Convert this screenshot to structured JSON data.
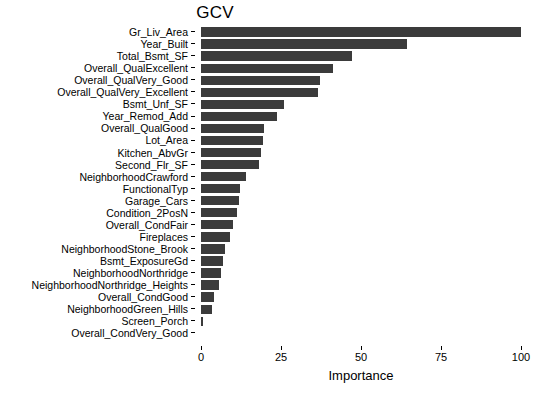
{
  "chart_data": {
    "type": "bar",
    "orientation": "horizontal",
    "title": "GCV",
    "xlabel": "Importance",
    "ylabel": "",
    "xlim": [
      0,
      100
    ],
    "xticks": [
      0,
      25,
      50,
      75,
      100
    ],
    "xtick_labels": [
      "0",
      "25",
      "50",
      "75",
      "100"
    ],
    "grid": false,
    "legend": null,
    "bar_color": "#3b3b3b",
    "background_color": "#ffffff",
    "categories": [
      "Gr_Liv_Area",
      "Year_Built",
      "Total_Bsmt_SF",
      "Overall_QualExcellent",
      "Overall_QualVery_Good",
      "Overall_QualVery_Excellent",
      "Bsmt_Unf_SF",
      "Year_Remod_Add",
      "Overall_QualGood",
      "Lot_Area",
      "Kitchen_AbvGr",
      "Second_Flr_SF",
      "NeighborhoodCrawford",
      "FunctionalTyp",
      "Garage_Cars",
      "Condition_2PosN",
      "Overall_CondFair",
      "Fireplaces",
      "NeighborhoodStone_Brook",
      "Bsmt_ExposureGd",
      "NeighborhoodNorthridge",
      "NeighborhoodNorthridge_Heights",
      "Overall_CondGood",
      "NeighborhoodGreen_Hills",
      "Screen_Porch",
      "Overall_CondVery_Good"
    ],
    "values": [
      100.0,
      64.5,
      47.2,
      41.2,
      37.3,
      36.5,
      26.0,
      23.8,
      19.8,
      19.3,
      18.6,
      18.0,
      14.2,
      12.3,
      11.9,
      11.2,
      10.0,
      9.2,
      7.6,
      6.8,
      6.2,
      5.6,
      4.2,
      3.4,
      0.7,
      0.0
    ]
  }
}
